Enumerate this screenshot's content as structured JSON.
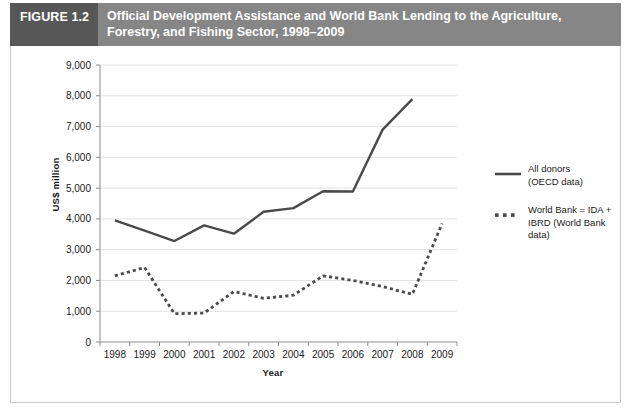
{
  "figure": {
    "number_label": "FIGURE 1.2",
    "title": "Official Development Assistance and World Bank Lending to the Agriculture, Forestry, and Fishing Sector, 1998–2009",
    "header_dark_color": "#575757",
    "header_light_color": "#868686"
  },
  "chart_data": {
    "type": "line",
    "title": "Official Development Assistance and World Bank Lending to the Agriculture, Forestry, and Fishing Sector, 1998–2009",
    "xlabel": "Year",
    "ylabel": "US$ million",
    "categories": [
      "1998",
      "1999",
      "2000",
      "2001",
      "2002",
      "2003",
      "2004",
      "2005",
      "2006",
      "2007",
      "2008",
      "2009"
    ],
    "ylim": [
      0,
      9000
    ],
    "ytick_step": 1000,
    "ytick_labels": [
      "0",
      "1,000",
      "2,000",
      "3,000",
      "4,000",
      "5,000",
      "6,000",
      "7,000",
      "8,000",
      "9,000"
    ],
    "grid": true,
    "legend_position": "right",
    "series": [
      {
        "name": "All donors (OECD data)",
        "style": "solid",
        "color": "#4a4a4a",
        "values": [
          3950,
          3620,
          3280,
          3790,
          3520,
          4230,
          4350,
          4900,
          4890,
          6900,
          7890,
          null
        ]
      },
      {
        "name": "World Bank = IDA + IBRD (World Bank data)",
        "style": "dotted",
        "color": "#4a4a4a",
        "values": [
          2150,
          2420,
          920,
          940,
          1640,
          1420,
          1520,
          2150,
          2000,
          1800,
          1550,
          3850
        ]
      }
    ],
    "legend": [
      {
        "line1": "All donors",
        "line2": "(OECD data)",
        "style": "solid"
      },
      {
        "line1": "World Bank = IDA +",
        "line2": "IBRD (World Bank data)",
        "style": "dotted"
      }
    ]
  }
}
